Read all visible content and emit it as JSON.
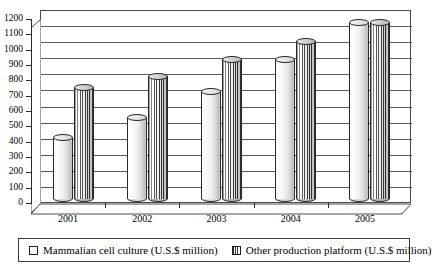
{
  "chart_data": {
    "type": "bar",
    "title": "",
    "xlabel": "",
    "ylabel": "",
    "ylim": [
      0,
      1200
    ],
    "ytick_step": 100,
    "grid": true,
    "legend_position": "bottom",
    "style": "3d-cylinder",
    "categories": [
      "2001",
      "2002",
      "2003",
      "2004",
      "2005"
    ],
    "yticks": [
      "0",
      "100",
      "200",
      "300",
      "400",
      "500",
      "600",
      "700",
      "800",
      "900",
      "1000",
      "1100",
      "1200"
    ],
    "series": [
      {
        "name": "Mammalian cell culture (U.S.$ million)",
        "marker": "open-square",
        "values": [
          400,
          530,
          700,
          910,
          1150
        ]
      },
      {
        "name": "Other production platform (U.S.$ million)",
        "marker": "hatched-square",
        "values": [
          730,
          800,
          910,
          1030,
          1150
        ]
      }
    ]
  },
  "colors": {
    "axis": "#2b2b2b",
    "grid": "#5c5c5c",
    "series_a_fill": "#f2f2f2",
    "series_b_fill": "#d9d9d9",
    "background": "#ffffff"
  }
}
